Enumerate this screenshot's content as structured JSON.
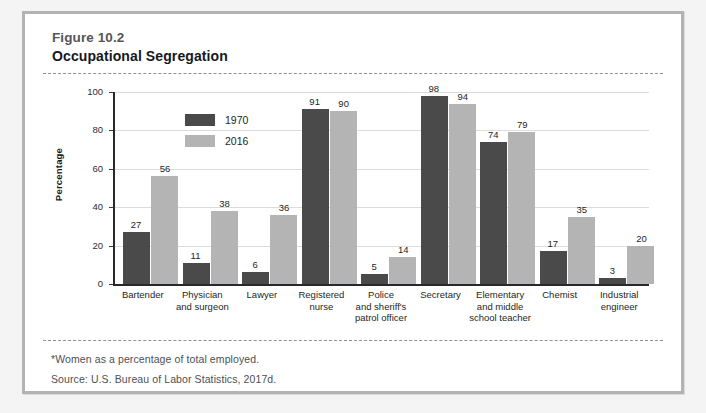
{
  "figure": {
    "number": "Figure 10.2",
    "title": "Occupational Segregation",
    "note": "*Women as a percentage of total employed.",
    "source": "Source: U.S. Bureau of Labor Statistics, 2017d."
  },
  "colors": {
    "series_1970": "#4a4a4a",
    "series_2016": "#b4b4b4",
    "frame": "#b3b3b3",
    "gridline": "#dcdcdc",
    "axis": "#26282c"
  },
  "legend": {
    "position": "top-left-inside",
    "entries": [
      {
        "label": "1970",
        "color": "#4a4a4a"
      },
      {
        "label": "2016",
        "color": "#b4b4b4"
      }
    ]
  },
  "chart_data": {
    "type": "bar",
    "title": "Occupational Segregation",
    "xlabel": "",
    "ylabel": "Percentage",
    "ylim": [
      0,
      100
    ],
    "yticks": [
      0,
      20,
      40,
      60,
      80,
      100
    ],
    "grid": true,
    "categories": [
      "Bartender",
      "Physician and surgeon",
      "Lawyer",
      "Registered nurse",
      "Police and sheriff's patrol officer",
      "Secretary",
      "Elementary and middle school teacher",
      "Chemist",
      "Industrial engineer"
    ],
    "category_lines": [
      [
        "Bartender"
      ],
      [
        "Physician",
        "and surgeon"
      ],
      [
        "Lawyer"
      ],
      [
        "Registered",
        "nurse"
      ],
      [
        "Police",
        "and sheriff's",
        "patrol officer"
      ],
      [
        "Secretary"
      ],
      [
        "Elementary",
        "and middle",
        "school teacher"
      ],
      [
        "Chemist"
      ],
      [
        "Industrial",
        "engineer"
      ]
    ],
    "series": [
      {
        "name": "1970",
        "values": [
          27,
          11,
          6,
          91,
          5,
          98,
          74,
          17,
          3
        ]
      },
      {
        "name": "2016",
        "values": [
          56,
          38,
          36,
          90,
          14,
          94,
          79,
          35,
          20
        ]
      }
    ]
  }
}
